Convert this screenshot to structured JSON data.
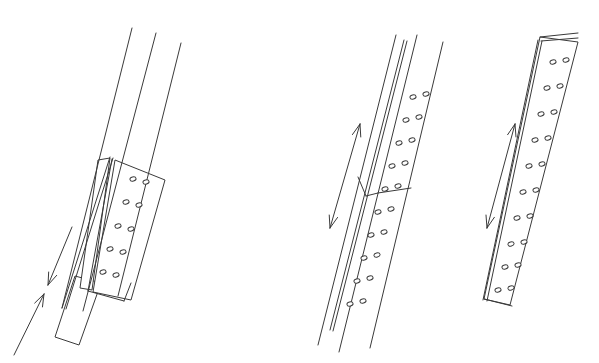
{
  "document": {
    "title": "Telescoping Perforated Square Post Assembly",
    "type": "technical-line-drawing",
    "background_color": "#ffffff",
    "line_color": "#3a3a3a",
    "line_width": 1.0,
    "figure_count": 3
  },
  "figures": [
    {
      "id": "figure-1",
      "name": "telescoping-post-extended",
      "label": "",
      "description": "Perforated square tube sleeve with inner post telescoping out of the lower end",
      "motion_indicator": "two single-headed arrows, one down one up",
      "hole_rows": 5,
      "holes_per_row": 2
    },
    {
      "id": "figure-2",
      "name": "spliced-post-joint",
      "label": "",
      "description": "Two perforated square tube sections joined end to end with a mitred splice line",
      "motion_indicator": "double-headed arrow",
      "hole_rows": 10,
      "holes_per_row": 2
    },
    {
      "id": "figure-3",
      "name": "perforated-flat-bar",
      "label": "",
      "description": "Single perforated flat bar / post shown closed at both ends",
      "motion_indicator": "double-headed arrow",
      "hole_rows": 10,
      "holes_per_row": 2
    }
  ],
  "geometry": {
    "figure1": {
      "long_lines": [
        {
          "name": "outer-left-edge",
          "x1": 132,
          "y1": 28,
          "x2": 62,
          "y2": 308
        },
        {
          "name": "outer-mid-edge",
          "x1": 156,
          "y1": 33,
          "x2": 83,
          "y2": 311
        },
        {
          "name": "outer-right-edge",
          "x1": 181,
          "y1": 43,
          "x2": 118,
          "y2": 296
        }
      ],
      "sleeve_front": {
        "name": "front-face-quad",
        "points": "110,158 98,160 80,288 92,290"
      },
      "sleeve_face": {
        "name": "perforated-face-quad",
        "points": "115,160 165,180 131,300 93,292"
      },
      "face_outline": [
        {
          "name": "face-left-edge",
          "x1": 112,
          "y1": 159,
          "x2": 88,
          "y2": 291
        },
        {
          "name": "face-bottom-edge",
          "x1": 88,
          "y1": 291,
          "x2": 124,
          "y2": 301
        },
        {
          "name": "face-right-stub",
          "x1": 124,
          "y1": 301,
          "x2": 131,
          "y2": 283
        }
      ],
      "inner_post": {
        "name": "inner-post-quad",
        "points": "75,276 101,283 79,345 55,337"
      },
      "ribs": [
        {
          "name": "rib-line-a",
          "x1": 110,
          "y1": 157,
          "x2": 62,
          "y2": 308
        },
        {
          "name": "rib-line-b",
          "x1": 113,
          "y1": 158,
          "x2": 66,
          "y2": 309
        }
      ],
      "holes": [
        {
          "cx": 133,
          "cy": 179
        },
        {
          "cx": 146,
          "cy": 182
        },
        {
          "cx": 126,
          "cy": 202
        },
        {
          "cx": 139,
          "cy": 205
        },
        {
          "cx": 118,
          "cy": 226
        },
        {
          "cx": 131,
          "cy": 229
        },
        {
          "cx": 110,
          "cy": 249
        },
        {
          "cx": 123,
          "cy": 252
        },
        {
          "cx": 103,
          "cy": 272
        },
        {
          "cx": 116,
          "cy": 275
        }
      ],
      "arrows": [
        {
          "name": "arrow-down",
          "x1": 72,
          "y1": 227,
          "x2": 48,
          "y2": 285,
          "head": "end"
        },
        {
          "name": "arrow-up",
          "x1": 14,
          "y1": 355,
          "x2": 44,
          "y2": 294,
          "head": "end"
        }
      ]
    },
    "figure2": {
      "long_lines": [
        {
          "name": "left-outer-edge",
          "x1": 396,
          "y1": 35,
          "x2": 318,
          "y2": 345
        },
        {
          "name": "face-left-edge",
          "x1": 417,
          "y1": 35,
          "x2": 339,
          "y2": 352
        },
        {
          "name": "face-right-edge",
          "x1": 443,
          "y1": 42,
          "x2": 370,
          "y2": 348
        }
      ],
      "ribs": [
        {
          "name": "rib-line-a",
          "x1": 404,
          "y1": 40,
          "x2": 330,
          "y2": 330
        },
        {
          "name": "rib-line-b",
          "x1": 407,
          "y1": 41,
          "x2": 333,
          "y2": 331
        }
      ],
      "splice": [
        {
          "name": "splice-left-riser",
          "x1": 358,
          "y1": 177,
          "x2": 366,
          "y2": 196
        },
        {
          "name": "splice-vee-left",
          "x1": 366,
          "y1": 196,
          "x2": 378,
          "y2": 193
        },
        {
          "name": "splice-vee-right",
          "x1": 378,
          "y1": 193,
          "x2": 411,
          "y2": 188
        }
      ],
      "holes": [
        {
          "cx": 413,
          "cy": 97
        },
        {
          "cx": 426,
          "cy": 94
        },
        {
          "cx": 406,
          "cy": 120
        },
        {
          "cx": 419,
          "cy": 117
        },
        {
          "cx": 399,
          "cy": 143
        },
        {
          "cx": 412,
          "cy": 140
        },
        {
          "cx": 392,
          "cy": 166
        },
        {
          "cx": 405,
          "cy": 163
        },
        {
          "cx": 385,
          "cy": 189
        },
        {
          "cx": 398,
          "cy": 186
        },
        {
          "cx": 378,
          "cy": 212
        },
        {
          "cx": 391,
          "cy": 209
        },
        {
          "cx": 371,
          "cy": 235
        },
        {
          "cx": 384,
          "cy": 232
        },
        {
          "cx": 364,
          "cy": 258
        },
        {
          "cx": 377,
          "cy": 255
        },
        {
          "cx": 357,
          "cy": 281
        },
        {
          "cx": 370,
          "cy": 278
        },
        {
          "cx": 350,
          "cy": 304
        },
        {
          "cx": 363,
          "cy": 301
        }
      ],
      "arrow": {
        "name": "double-arrow",
        "x1": 330,
        "y1": 228,
        "x2": 360,
        "y2": 124,
        "head": "both"
      }
    },
    "figure3": {
      "plate": {
        "name": "plate-face-quad",
        "points": "540,37 578,42 510,305 484,299"
      },
      "edge_band": [
        {
          "name": "edge-band-line-a",
          "x1": 538,
          "y1": 40,
          "x2": 483,
          "y2": 300
        },
        {
          "name": "edge-band-line-b",
          "x1": 542,
          "y1": 41,
          "x2": 487,
          "y2": 301
        }
      ],
      "top_cap": [
        {
          "name": "top-cap-line-a",
          "x1": 540,
          "y1": 37,
          "x2": 578,
          "y2": 33
        },
        {
          "name": "top-cap-line-b",
          "x1": 541,
          "y1": 41,
          "x2": 578,
          "y2": 38
        }
      ],
      "bottom_cap": {
        "name": "bottom-cap-line",
        "x1": 484,
        "y1": 299,
        "x2": 512,
        "y2": 306
      },
      "holes": [
        {
          "cx": 553,
          "cy": 62
        },
        {
          "cx": 566,
          "cy": 60
        },
        {
          "cx": 547,
          "cy": 88
        },
        {
          "cx": 560,
          "cy": 86
        },
        {
          "cx": 541,
          "cy": 114
        },
        {
          "cx": 554,
          "cy": 112
        },
        {
          "cx": 535,
          "cy": 140
        },
        {
          "cx": 548,
          "cy": 138
        },
        {
          "cx": 529,
          "cy": 166
        },
        {
          "cx": 542,
          "cy": 164
        },
        {
          "cx": 523,
          "cy": 192
        },
        {
          "cx": 536,
          "cy": 190
        },
        {
          "cx": 517,
          "cy": 218
        },
        {
          "cx": 530,
          "cy": 216
        },
        {
          "cx": 511,
          "cy": 244
        },
        {
          "cx": 524,
          "cy": 242
        },
        {
          "cx": 505,
          "cy": 267
        },
        {
          "cx": 518,
          "cy": 265
        },
        {
          "cx": 498,
          "cy": 290
        },
        {
          "cx": 511,
          "cy": 288
        }
      ],
      "arrow": {
        "name": "double-arrow",
        "x1": 487,
        "y1": 228,
        "x2": 515,
        "y2": 124,
        "head": "both"
      }
    }
  }
}
